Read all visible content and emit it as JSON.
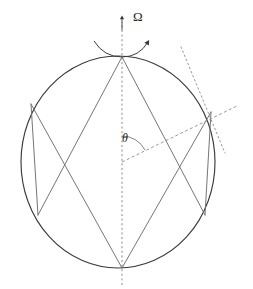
{
  "figure": {
    "background_color": "#ffffff",
    "width": 253,
    "height": 289
  },
  "labels": {
    "rotation_rate": "Ω",
    "colatitude_angle": "θ"
  },
  "colors": {
    "circle_stroke": "#3b3b3f",
    "ray_stroke": "#6e6e73",
    "axis_dash": "#7a7a80",
    "radial_dash": "#8c8c92",
    "tangent_dot": "#8c8c92",
    "arrow": "#3b3b3f",
    "text": "#231f20"
  },
  "geometry": {
    "circle": {
      "center_x": 118,
      "center_y": 162,
      "radius_x": 97,
      "radius_y": 106,
      "stroke_width": 1.1
    },
    "rotation_axis": {
      "x": 122,
      "y_top": 18,
      "y_bottom": 285,
      "dash": "2,2.6",
      "arrow_tip_y": 18
    },
    "omega_arrow": {
      "path": "M 96 40 Q 108 56 124 56 Q 140 56 150 40",
      "arrow_angle_deg": -55
    },
    "vertices": {
      "top": [
        122,
        57
      ],
      "bottom": [
        122,
        268
      ],
      "upper_left": [
        31,
        104
      ],
      "upper_right": [
        211,
        112
      ],
      "lower_left": [
        38,
        215
      ],
      "lower_right": [
        205,
        215
      ]
    },
    "rays": [
      {
        "name": "ray-top-to-lower-left",
        "from": [
          122,
          57
        ],
        "to": [
          38,
          215
        ]
      },
      {
        "name": "ray-top-to-lower-right",
        "from": [
          122,
          57
        ],
        "to": [
          205,
          215
        ]
      },
      {
        "name": "ray-bottom-to-upper-left",
        "from": [
          122,
          268
        ],
        "to": [
          31,
          104
        ]
      },
      {
        "name": "ray-bottom-to-upper-right",
        "from": [
          122,
          268
        ],
        "to": [
          211,
          112
        ]
      },
      {
        "name": "ray-upper-left-to-lower-left",
        "from": [
          31,
          104
        ],
        "to": [
          38,
          215
        ]
      },
      {
        "name": "ray-upper-right-to-lower-right",
        "from": [
          211,
          112
        ],
        "to": [
          205,
          215
        ]
      }
    ],
    "radial_line": {
      "from": [
        122,
        162
      ],
      "to": [
        236,
        107
      ],
      "dash": "3,2.4"
    },
    "tangent_line": {
      "from": [
        181,
        48
      ],
      "to": [
        224,
        152
      ],
      "dash": "1.6,2.6"
    },
    "theta_arc": {
      "center": [
        122,
        162
      ],
      "radius": 26,
      "start_deg": -90,
      "end_deg": -26
    }
  },
  "annotations": {
    "omega_meaning": "rotation rate about the vertical axis",
    "theta_meaning": "angle between rotation axis and radial direction"
  }
}
